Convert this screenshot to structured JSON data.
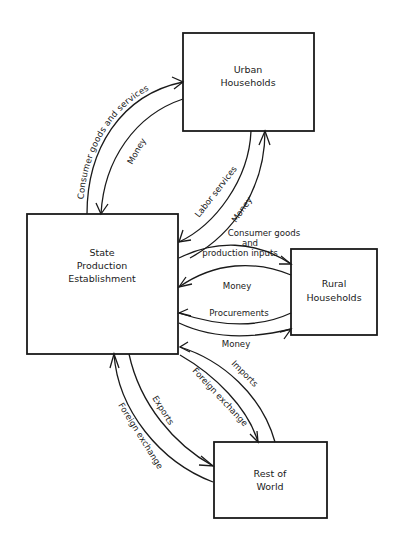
{
  "nodes": {
    "urban": {
      "line1": "Urban",
      "line2": "Households"
    },
    "state": {
      "line1": "State",
      "line2": "Production",
      "line3": "Establishment"
    },
    "rural": {
      "line1": "Rural",
      "line2": "Households"
    },
    "world": {
      "line1": "Rest of",
      "line2": "World"
    }
  },
  "flows": {
    "state_to_urban_goods": "Consumer goods and services",
    "urban_to_state_money": "Money",
    "urban_to_state_labor": "Labor services",
    "state_to_urban_money": "Money",
    "state_to_rural_goods_line1": "Consumer goods",
    "state_to_rural_goods_line2": "and",
    "state_to_rural_goods_line3": "production inputs",
    "rural_to_state_money": "Money",
    "rural_to_state_procurements": "Procurements",
    "state_to_rural_money": "Money",
    "world_to_state_imports": "Imports",
    "state_to_world_fx": "Foreign exchange",
    "state_to_world_exports": "Exports",
    "world_to_state_fx": "Foreign exchange"
  }
}
